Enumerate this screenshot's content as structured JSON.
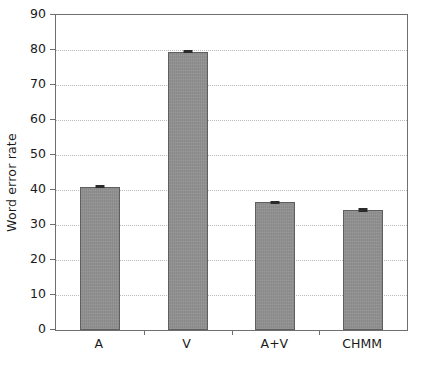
{
  "chart_data": {
    "type": "bar",
    "title": "",
    "xlabel": "",
    "ylabel": "Word error rate",
    "categories": [
      "A",
      "V",
      "A+V",
      "CHMM"
    ],
    "values": [
      41.0,
      79.5,
      36.5,
      34.3
    ],
    "errors": [
      0.5,
      0.4,
      0.5,
      0.5
    ],
    "ylim": [
      0,
      90
    ],
    "yticks": [
      0,
      10,
      20,
      30,
      40,
      50,
      60,
      70,
      80,
      90
    ],
    "ytick_labels": [
      "0",
      "10",
      "20",
      "30",
      "40",
      "50",
      "60",
      "70",
      "80",
      "90"
    ],
    "grid": true,
    "grid_axis": "y",
    "grid_style": "dotted",
    "legend": false,
    "bar_color": "#8f8f8f",
    "bar_edge_color": "#5f5f5f",
    "error_color": "#2a2a2a",
    "axis_color": "#6f6f6f",
    "grid_color": "#b9b9b9",
    "background": "#ffffff"
  }
}
